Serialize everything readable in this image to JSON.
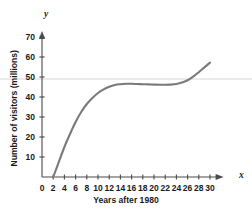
{
  "chart_data": {
    "type": "line",
    "title": "",
    "xlabel": "Years after 1980",
    "ylabel": "Number of visitors (millions)",
    "x_axis_name": "x",
    "y_axis_name": "y",
    "xlim": [
      0,
      31
    ],
    "ylim": [
      0,
      74
    ],
    "xticks": [
      0,
      2,
      4,
      6,
      8,
      10,
      12,
      14,
      16,
      18,
      20,
      22,
      24,
      26,
      28,
      30
    ],
    "xtick_labels": [
      "0",
      "2",
      "4",
      "6",
      "8",
      "10",
      "12",
      "14",
      "16",
      "18",
      "20",
      "22",
      "24",
      "26",
      "28",
      "30"
    ],
    "yticks": [
      10,
      20,
      30,
      40,
      50,
      60,
      70
    ],
    "ytick_labels": [
      "10",
      "20",
      "30",
      "40",
      "50",
      "60",
      "70"
    ],
    "grid": false,
    "legend": null,
    "reference_line": {
      "orientation": "horizontal",
      "y": 49,
      "color": "#e4e4e4"
    },
    "series": [
      {
        "name": "visitors",
        "color": "#7a7a7a",
        "linewidth": 2.1,
        "x": [
          2,
          3,
          4,
          5,
          6,
          7,
          8,
          9,
          10,
          11,
          12,
          13,
          14,
          15,
          16,
          17,
          18,
          19,
          20,
          21,
          22,
          23,
          24,
          25,
          26,
          27,
          28,
          29,
          30
        ],
        "y": [
          0,
          7.5,
          15,
          21.5,
          27.5,
          32.5,
          36.5,
          39.5,
          42,
          43.8,
          45.1,
          46,
          46.4,
          46.6,
          46.6,
          46.5,
          46.4,
          46.3,
          46.2,
          46.1,
          46.1,
          46.2,
          46.5,
          47.2,
          48.4,
          50.2,
          52.4,
          54.8,
          57.2
        ]
      }
    ]
  },
  "axes_geometry": {
    "x_origin_px": 42,
    "y_zero_px": 177,
    "px_per_x_unit": 5.6,
    "px_per_y_unit": 2.0
  }
}
